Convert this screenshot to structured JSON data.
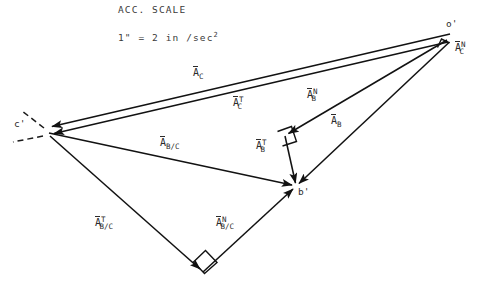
{
  "header": {
    "scale_title": "ACC. SCALE",
    "scale_prefix": "1\" = 2 in /sec",
    "scale_exponent": "2"
  },
  "points": [
    {
      "id": "o-prime",
      "label": "o'",
      "x": 450,
      "y": 38
    },
    {
      "id": "c-prime",
      "label": "c'",
      "x": 47,
      "y": 131
    },
    {
      "id": "b-prime",
      "label": "b'",
      "x": 296,
      "y": 186
    },
    {
      "id": "x-node",
      "label": "",
      "x": 285,
      "y": 136
    },
    {
      "id": "n-node",
      "label": "",
      "x": 203,
      "y": 272
    }
  ],
  "vectors": {
    "a_c": {
      "base": "A",
      "sup": "",
      "sub": "C",
      "x": 193,
      "y": 68
    },
    "a_c_t": {
      "base": "A",
      "sup": "T",
      "sub": "C",
      "x": 233,
      "y": 96
    },
    "a_b_n": {
      "base": "A",
      "sup": "N",
      "sub": "B",
      "x": 307,
      "y": 88
    },
    "a_b": {
      "base": "A",
      "sup": "",
      "sub": "B",
      "x": 331,
      "y": 116
    },
    "a_b_t": {
      "base": "A",
      "sup": "T",
      "sub": "B",
      "x": 256,
      "y": 139
    },
    "a_bc": {
      "base": "A",
      "sup": "",
      "sub": "B/C",
      "x": 160,
      "y": 138
    },
    "a_bc_t": {
      "base": "A",
      "sup": "T",
      "sub": "B/C",
      "x": 95,
      "y": 216
    },
    "a_bc_n": {
      "base": "A",
      "sup": "N",
      "sub": "B/C",
      "x": 216,
      "y": 216
    },
    "a_c_n": {
      "base": "A",
      "sup": "N",
      "sub": "C",
      "x": 455,
      "y": 41
    }
  },
  "colors": {
    "ink": "#1a1a1a",
    "text": "#2b2b2b",
    "background": "#ffffff"
  },
  "geometry": {
    "strokes": [
      {
        "name": "oc-outer",
        "x1": 450,
        "y1": 34,
        "x2": 47,
        "y2": 127,
        "arrow": "end"
      },
      {
        "name": "oc-inner",
        "x1": 448,
        "y1": 42,
        "x2": 49,
        "y2": 134,
        "arrow": "end"
      },
      {
        "name": "ob",
        "x1": 449,
        "y1": 42,
        "x2": 296,
        "y2": 186,
        "arrow": "end"
      },
      {
        "name": "ox",
        "x1": 447,
        "y1": 40,
        "x2": 285,
        "y2": 136,
        "arrow": "end"
      },
      {
        "name": "xb",
        "x1": 285,
        "y1": 136,
        "x2": 296,
        "y2": 186,
        "arrow": "end"
      },
      {
        "name": "cb",
        "x1": 49,
        "y1": 133,
        "x2": 296,
        "y2": 186,
        "arrow": "end"
      },
      {
        "name": "cn",
        "x1": 50,
        "y1": 136,
        "x2": 203,
        "y2": 272,
        "arrow": "end"
      },
      {
        "name": "nb",
        "x1": 203,
        "y1": 272,
        "x2": 296,
        "y2": 186,
        "arrow": "end"
      },
      {
        "name": "dash-a",
        "x1": 43,
        "y1": 127,
        "x2": 22,
        "y2": 112,
        "arrow": "none"
      },
      {
        "name": "dash-b",
        "x1": 43,
        "y1": 136,
        "x2": 14,
        "y2": 142,
        "arrow": "none"
      }
    ],
    "right_angles": [
      {
        "name": "right-angle-o",
        "x": 443,
        "y": 45,
        "rot": -150
      },
      {
        "name": "right-angle-x",
        "x": 285,
        "y": 140,
        "rot": 22
      },
      {
        "name": "right-angle-n",
        "x": 203,
        "y": 266,
        "rot": 45
      }
    ]
  }
}
